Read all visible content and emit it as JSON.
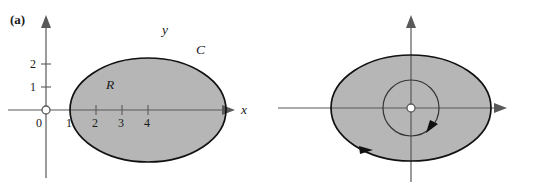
{
  "figure": {
    "type": "math-diagram",
    "background_color": "#ffffff",
    "region_fill_color": "#b6b6b6",
    "curve_color": "#111111",
    "axis_color": "#595959"
  },
  "panels": [
    {
      "tag": "(a)",
      "axes": {
        "x_label": "x",
        "y_label": "y",
        "origin_label": "0",
        "x_ticks": [
          "1",
          "2",
          "3",
          "4"
        ],
        "y_ticks": [
          "1",
          "2"
        ]
      },
      "region_label": "R",
      "curve_label": "C",
      "shapes": [
        {
          "name": "outer-ellipse",
          "kind": "ellipse",
          "center_x": 3,
          "center_y": 0,
          "radius_x": 2,
          "radius_y": 1.55,
          "filled": true,
          "orientation": "none"
        }
      ]
    },
    {
      "tag": "(b)",
      "axes": {
        "x_label": "x",
        "y_label": "y",
        "origin_label": "0",
        "x_ticks": [
          "-3",
          "1",
          "3"
        ],
        "y_ticks": [
          "2"
        ]
      },
      "region_label": "R'",
      "curve_label": "C",
      "inner_label": "D",
      "shapes": [
        {
          "name": "outer-ellipse",
          "kind": "ellipse",
          "center_x": 0,
          "center_y": 0,
          "radius_x": 3,
          "radius_y": 2,
          "filled": true,
          "orientation": "counterclockwise"
        },
        {
          "name": "inner-circle",
          "kind": "circle",
          "center_x": 0,
          "center_y": 0,
          "radius": 1,
          "filled": true,
          "orientation": "counterclockwise"
        }
      ]
    }
  ]
}
